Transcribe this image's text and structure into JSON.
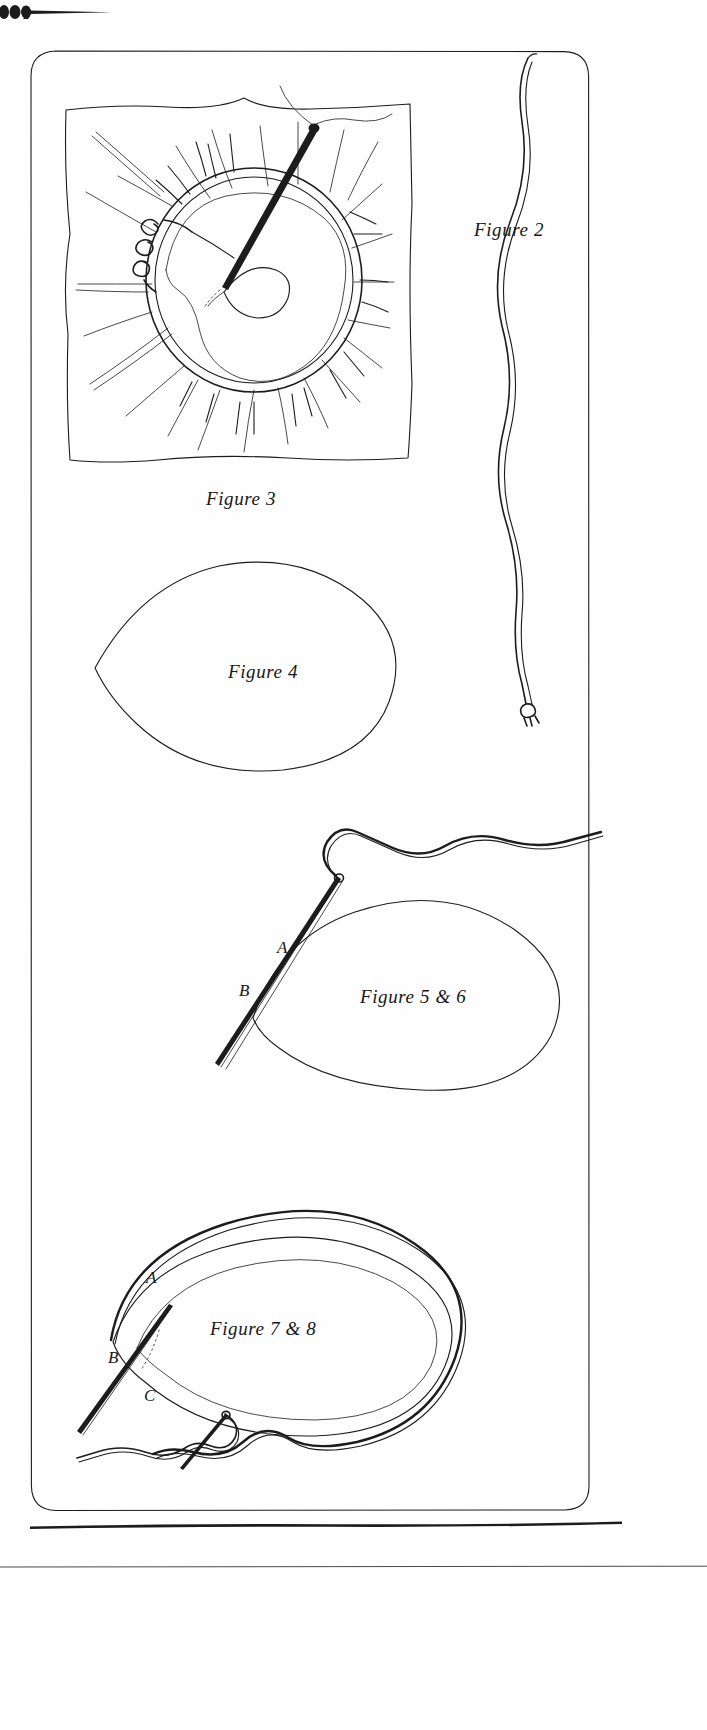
{
  "page": {
    "type": "scanned-book-page",
    "width": 707,
    "height": 1730,
    "background_color": "#ffffff",
    "ink_color": "#1c1c1c"
  },
  "ornament": {
    "name": "typographic-flourish",
    "description": "tapering horizontal rule with three ink dots at the left end"
  },
  "frame": {
    "name": "rounded-rectangle-border",
    "corner_radius": 26
  },
  "figures": [
    {
      "id": "figure-2",
      "caption": "Figure 2",
      "subject": "long wavy double thread with a knotted end",
      "position": "right column"
    },
    {
      "id": "figure-3",
      "caption": "Figure 3",
      "subject": "embroidery hoop on a square of fabric with radiating stitch rays, a threaded needle and a knot of thread",
      "position": "upper left"
    },
    {
      "id": "figure-4",
      "caption": "Figure 4",
      "subject": "pear / teardrop shaped outline pattern piece",
      "position": "middle left"
    },
    {
      "id": "figure-5-6",
      "caption": "Figure 5 & 6",
      "subject": "teardrop outline with threaded needle entering at point A and exiting at point B",
      "position": "middle right",
      "point_labels": [
        "A",
        "B"
      ]
    },
    {
      "id": "figure-7-8",
      "caption": "Figure 7 & 8",
      "subject": "teardrop outline with a running thread stitched over the top edge, marked points A, B and C, and a second threaded needle below",
      "position": "lower",
      "point_labels": [
        "A",
        "B",
        "C"
      ]
    }
  ],
  "labels": {
    "fig2": "Figure 2",
    "fig3": "Figure 3",
    "fig4": "Figure 4",
    "fig56": "Figure 5 & 6",
    "fig78": "Figure 7 & 8",
    "a56": "A",
    "b56": "B",
    "a78": "A",
    "b78": "B",
    "c78": "C"
  }
}
